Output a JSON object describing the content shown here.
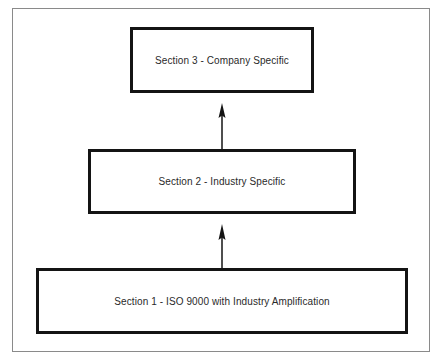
{
  "diagram": {
    "type": "hierarchy-flow",
    "direction": "bottom-to-top",
    "boxes": [
      {
        "id": "section-3",
        "label": "Section 3 - Company Specific"
      },
      {
        "id": "section-2",
        "label": "Section 2 - Industry Specific"
      },
      {
        "id": "section-1",
        "label": "Section 1 - ISO 9000 with Industry Amplification"
      }
    ],
    "edges": [
      {
        "from": "section-1",
        "to": "section-2"
      },
      {
        "from": "section-2",
        "to": "section-3"
      }
    ],
    "colors": {
      "box_border": "#141414",
      "frame_border": "#8a8a8a",
      "text": "#2a2a2a",
      "background": "#ffffff"
    }
  }
}
